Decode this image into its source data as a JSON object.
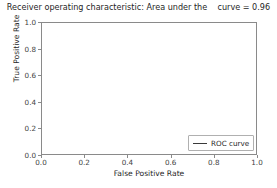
{
  "chart_data": {
    "type": "line",
    "title": "Receiver operating characteristic: Area under the    curve = 0.96",
    "xlabel": "False Positive Rate",
    "ylabel": "True Positive Rate",
    "xlim": [
      0.0,
      1.0
    ],
    "ylim": [
      0.0,
      1.0
    ],
    "grid": false,
    "legend_position": "lower right",
    "xticks": [
      "0.0",
      "0.2",
      "0.4",
      "0.6",
      "0.8",
      "1.0"
    ],
    "xtick_values": [
      0.0,
      0.2,
      0.4,
      0.6,
      0.8,
      1.0
    ],
    "yticks": [
      "0.0",
      "0.2",
      "0.4",
      "0.6",
      "0.8",
      "1.0"
    ],
    "ytick_values": [
      0.0,
      0.2,
      0.4,
      0.6,
      0.8,
      1.0
    ],
    "auc": 0.96,
    "series": [
      {
        "name": "ROC curve",
        "style": "solid",
        "color": "#3a3a3a",
        "x": [
          0.0,
          0.004,
          0.008,
          0.013,
          0.02,
          0.028,
          0.038,
          0.05,
          0.063,
          0.08,
          0.098,
          0.118,
          0.14,
          0.165,
          0.19,
          0.215,
          0.245,
          0.275,
          0.31,
          0.345,
          0.385,
          0.425,
          0.47,
          0.515,
          0.56,
          0.605,
          0.65,
          0.7,
          0.75,
          0.8,
          0.85,
          0.9,
          0.95,
          1.0
        ],
        "y": [
          0.0,
          0.8,
          0.815,
          0.828,
          0.845,
          0.862,
          0.875,
          0.885,
          0.893,
          0.9,
          0.905,
          0.909,
          0.913,
          0.917,
          0.92,
          0.923,
          0.927,
          0.93,
          0.934,
          0.937,
          0.941,
          0.944,
          0.948,
          0.951,
          0.955,
          0.958,
          0.961,
          0.964,
          0.968,
          0.971,
          0.975,
          0.98,
          0.988,
          1.0
        ]
      },
      {
        "name": "chance-diagonal",
        "style": "dashed",
        "color": "#000000",
        "x": [
          0.0,
          1.0
        ],
        "y": [
          0.0,
          1.0
        ]
      }
    ],
    "legend_entries": [
      "ROC curve"
    ]
  }
}
